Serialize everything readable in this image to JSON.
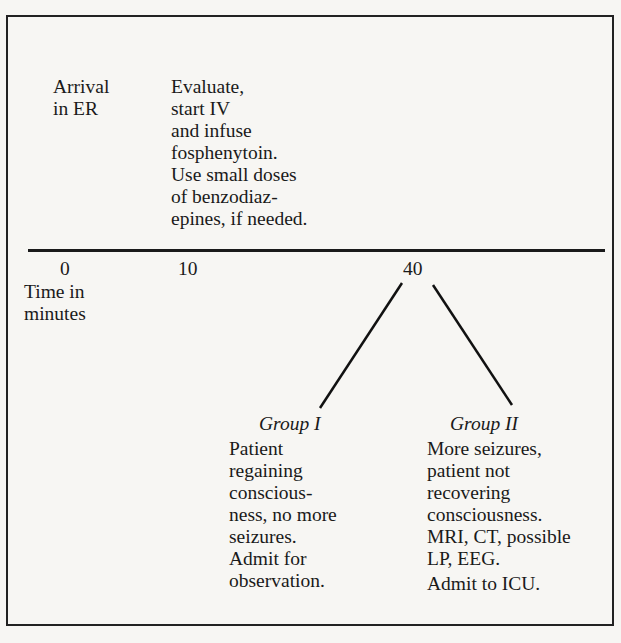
{
  "diagram": {
    "type": "timeline-flow",
    "top_events": [
      {
        "label": "Arrival\nin ER"
      },
      {
        "label": "Evaluate,\nstart IV\nand infuse\nfosphenytoin.\nUse small doses\nof benzodiaz-\nepines, if needed."
      }
    ],
    "ticks": [
      "0",
      "10",
      "40"
    ],
    "axis_label": "Time in\nminutes",
    "branches": [
      {
        "title": "Group I",
        "text": "Patient\nregaining\nconscious-\nness, no more\nseizures.\nAdmit for\nobservation."
      },
      {
        "title": "Group II",
        "text": "More seizures,\npatient not\nrecovering\nconsciousness.\nMRI, CT, possible\nLP, EEG.",
        "text2": "Admit to ICU."
      }
    ]
  }
}
